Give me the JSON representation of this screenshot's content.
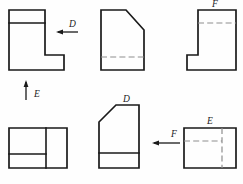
{
  "sheet": {
    "title": "orthographic-projection-views",
    "background_color": "#fefefe",
    "line_color": "#1a1a1a",
    "hidden_line_color": "#8e8e8e",
    "width": 243,
    "height": 184
  },
  "labels": {
    "d_top": "D",
    "e_left": "E",
    "f_top_right": "F",
    "d_bottom": "D",
    "f_bottom": "F",
    "e_bottom_right": "E"
  },
  "views": [
    {
      "id": "view-top-left",
      "name": "L-shaped front view with upper horizontal edge",
      "outline": "9,10 45,10 45,55 64,55 64,70 9,70",
      "visible_edges": [
        {
          "x1": 9,
          "y1": 23,
          "x2": 45,
          "y2": 23
        }
      ],
      "hidden_edges": []
    },
    {
      "id": "view-top-middle",
      "name": "Chamfered rectangle with hidden horizontal edge",
      "outline": "101,10 126,10 144,30 144,70 101,70",
      "visible_edges": [],
      "hidden_edges": [
        {
          "x1": 101,
          "y1": 57,
          "x2": 144,
          "y2": 57
        }
      ]
    },
    {
      "id": "view-top-right",
      "name": "Mirrored L-shape with hidden horizontal edge",
      "outline": "198,10 236,10 236,70 187,70 187,55 198,55",
      "visible_edges": [],
      "hidden_edges": [
        {
          "x1": 198,
          "y1": 23,
          "x2": 236,
          "y2": 23
        }
      ]
    },
    {
      "id": "view-bottom-left",
      "name": "Rectangle divided by vertical and partial horizontal edge",
      "outline": "9,128 67,128 67,168 9,168",
      "visible_edges": [
        {
          "x1": 46,
          "y1": 128,
          "x2": 46,
          "y2": 168
        },
        {
          "x1": 9,
          "y1": 154,
          "x2": 46,
          "y2": 154
        }
      ],
      "hidden_edges": []
    },
    {
      "id": "view-bottom-middle",
      "name": "Chamfered top-left shape with visible horizontal edge",
      "outline": "116,105 139,105 139,168 99,168 99,122",
      "visible_edges": [
        {
          "x1": 99,
          "y1": 153,
          "x2": 139,
          "y2": 153
        }
      ],
      "hidden_edges": []
    },
    {
      "id": "view-bottom-right",
      "name": "Rectangle with hidden horizontal and vertical edges",
      "outline": "184,128 236,128 236,168 184,168",
      "visible_edges": [],
      "hidden_edges": [
        {
          "x1": 184,
          "y1": 141,
          "x2": 222,
          "y2": 141
        },
        {
          "x1": 222,
          "y1": 128,
          "x2": 222,
          "y2": 168
        }
      ]
    }
  ],
  "arrows": [
    {
      "id": "arrow-d-top",
      "name": "direction-arrow-d-left",
      "direction": "left",
      "tail": {
        "x": 78,
        "y": 32
      },
      "head": {
        "x": 56,
        "y": 32
      },
      "label": "D",
      "label_pos": {
        "x": 69,
        "y": 26
      }
    },
    {
      "id": "arrow-e-left",
      "name": "direction-arrow-e-up",
      "direction": "up",
      "tail": {
        "x": 26,
        "y": 100
      },
      "head": {
        "x": 26,
        "y": 80
      },
      "label": "E",
      "label_pos": {
        "x": 34,
        "y": 96
      }
    },
    {
      "id": "arrow-f-bottom",
      "name": "direction-arrow-f-left",
      "direction": "left",
      "tail": {
        "x": 180,
        "y": 143
      },
      "head": {
        "x": 152,
        "y": 143
      },
      "label": "F",
      "label_pos": {
        "x": 171,
        "y": 136
      }
    }
  ],
  "standalone_labels": [
    {
      "id": "label-f-top-right",
      "name": "view-label-f",
      "text": "F",
      "x": 215,
      "y": 7
    },
    {
      "id": "label-d-bottom",
      "name": "view-label-d",
      "text": "D",
      "x": 125,
      "y": 102
    },
    {
      "id": "label-e-bottom-right",
      "name": "view-label-e",
      "text": "E",
      "x": 209,
      "y": 124
    }
  ]
}
